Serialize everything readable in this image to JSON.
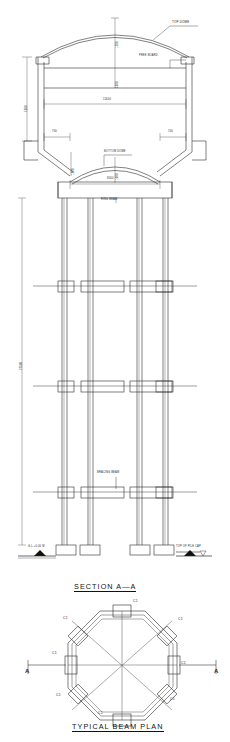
{
  "drawing": {
    "kind": "structural-elevation-and-plan",
    "discipline": "civil-structural",
    "subject": "elevated water tank on octagonal column staging",
    "line_color": "#2b2b2b",
    "hatch_color": "#101010",
    "background": "#ffffff"
  },
  "section_view": {
    "title": "SECTION  A—A",
    "annotations": {
      "top_dome": "TOP DOME",
      "free_board": "FREE BOARD",
      "bottom_dome": "BOTTOM DOME",
      "ring_beam": "RING BEAM",
      "bracing_beam": "BRACING BEAM",
      "top_of_pile_cap": "TOP OF PILE CAP",
      "ground_level": "G.L.+0.00 M"
    },
    "dimensions": {
      "tank_inner_diameter": "11600",
      "top_dome_rise": "1200",
      "free_board_depth": "300",
      "water_depth": "4500",
      "wall_height": "7500",
      "ring_beam_offset_left": "700",
      "ring_beam_offset_right": "700",
      "bottom_dome_span": "8000",
      "bottom_dome_rise": "1000",
      "conical_drop": "1500",
      "staging_height": "27500"
    }
  },
  "plan_view": {
    "title": "TYPICAL  BEAM  PLAN",
    "shape": "octagon",
    "column_count": 8,
    "column_mark": "C1",
    "column_marks": [
      "C1",
      "C1",
      "C1",
      "C1",
      "C1",
      "C1",
      "C1",
      "C1"
    ],
    "section_arrow_label_left": "A",
    "section_arrow_label_right": "A",
    "section_cut": "A—A"
  }
}
